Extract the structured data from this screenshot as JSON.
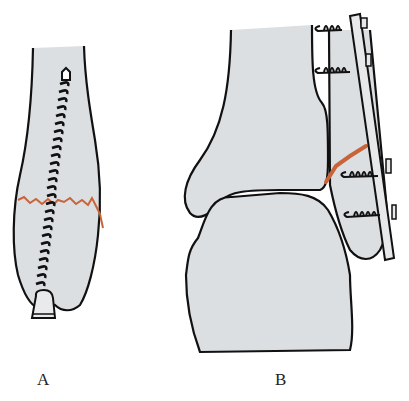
{
  "figure": {
    "panels": [
      {
        "id": "A",
        "label": "A",
        "description": "Medial malleolus fracture fixed with a single longitudinal lag screw"
      },
      {
        "id": "B",
        "label": "B",
        "description": "Lateral malleolus (fibula) oblique fracture fixed with a plate and screws"
      }
    ],
    "colors": {
      "bone_fill": "#dcdfe2",
      "outline": "#111111",
      "fracture_line": "#c8643a",
      "background": "#ffffff"
    },
    "icons": {
      "screw": "screw-icon",
      "plate": "plate-icon"
    }
  }
}
